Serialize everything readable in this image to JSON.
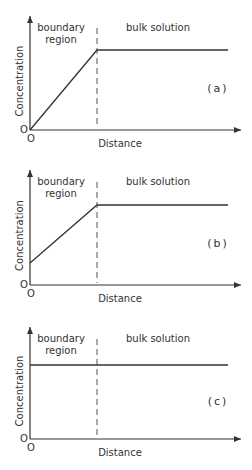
{
  "figure": {
    "panels": [
      {
        "id": "a",
        "label": "(a)",
        "ylabel": "Concentration",
        "xlabel": "Distance",
        "origin_x_label": "O",
        "origin_y_label": "O",
        "region_left_line1": "boundary",
        "region_left_line2": "region",
        "region_right": "bulk solution",
        "geom": {
          "top": 16,
          "origin_y": 130,
          "start_y": 130,
          "plateau_y": 50,
          "label_y": 92
        }
      },
      {
        "id": "b",
        "label": "(b)",
        "ylabel": "Concentration",
        "xlabel": "Distance",
        "origin_x_label": "O",
        "origin_y_label": "O",
        "region_left_line1": "boundary",
        "region_left_line2": "region",
        "region_right": "bulk solution",
        "geom": {
          "top": 170,
          "origin_y": 285,
          "start_y": 263,
          "plateau_y": 205,
          "label_y": 247
        }
      },
      {
        "id": "c",
        "label": "(c)",
        "ylabel": "Concentration",
        "xlabel": "Distance",
        "origin_x_label": "O",
        "origin_y_label": "O",
        "region_left_line1": "boundary",
        "region_left_line2": "region",
        "region_right": "bulk solution",
        "geom": {
          "top": 327,
          "origin_y": 439,
          "start_y": 365,
          "plateau_y": 365,
          "label_y": 405
        }
      }
    ]
  },
  "chart_data": [
    {
      "type": "line",
      "title": "(a)",
      "xlabel": "Distance",
      "ylabel": "Concentration",
      "annotations": [
        "boundary region",
        "bulk solution",
        "O",
        "O"
      ],
      "series": [
        {
          "name": "concentration profile",
          "x": [
            0,
            1,
            3
          ],
          "y": [
            0,
            1,
            1
          ]
        }
      ],
      "boundary_x": 1,
      "grid": false
    },
    {
      "type": "line",
      "title": "(b)",
      "xlabel": "Distance",
      "ylabel": "Concentration",
      "annotations": [
        "boundary region",
        "bulk solution",
        "O",
        "O"
      ],
      "series": [
        {
          "name": "concentration profile",
          "x": [
            0,
            1,
            3
          ],
          "y": [
            0.28,
            1,
            1
          ]
        }
      ],
      "boundary_x": 1,
      "grid": false
    },
    {
      "type": "line",
      "title": "(c)",
      "xlabel": "Distance",
      "ylabel": "Concentration",
      "annotations": [
        "boundary region",
        "bulk solution",
        "O",
        "O"
      ],
      "series": [
        {
          "name": "concentration profile",
          "x": [
            0,
            1,
            3
          ],
          "y": [
            1,
            1,
            1
          ]
        }
      ],
      "boundary_x": 1,
      "grid": false
    }
  ]
}
